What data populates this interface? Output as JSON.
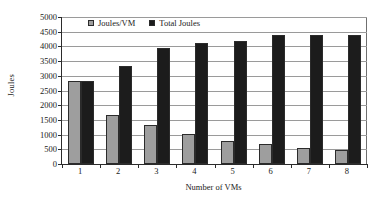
{
  "chart_data": {
    "type": "bar",
    "title": "",
    "subtitle": "",
    "xlabel": "Number of VMs",
    "ylabel": "Joules",
    "categories": [
      "1",
      "2",
      "3",
      "4",
      "5",
      "6",
      "7",
      "8"
    ],
    "series": [
      {
        "name": "Joules/VM",
        "color": "#9e9e9e",
        "values": [
          2830,
          1670,
          1320,
          1010,
          790,
          690,
          560,
          470
        ]
      },
      {
        "name": "Total Joules",
        "color": "#1c1c1c",
        "values": [
          2840,
          3320,
          3960,
          4120,
          4180,
          4400,
          4400,
          4400
        ]
      }
    ],
    "ylim": [
      0,
      5000
    ],
    "yticks": [
      0,
      500,
      1000,
      1500,
      2000,
      2500,
      3000,
      3500,
      4000,
      4500,
      5000
    ],
    "ytick_labels": [
      "0",
      "500",
      "1000",
      "1500",
      "2000",
      "2500",
      "3000",
      "3500",
      "4000",
      "4500",
      "5000"
    ],
    "grid": true,
    "grid_axis": "y",
    "legend_position": "top-left-inside",
    "legend": [
      "Joules/VM",
      "Total Joules"
    ]
  }
}
